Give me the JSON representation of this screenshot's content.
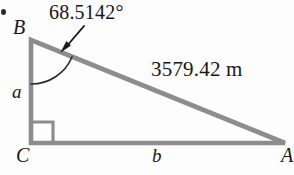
{
  "figure": {
    "type": "right-triangle-diagram",
    "stroke_color": "#8d8d8d",
    "accent_color": "#1a1a1a",
    "background_color": "#fdfdfd",
    "vertices": {
      "B": {
        "label": "B",
        "x": 31,
        "y": 40
      },
      "C": {
        "label": "C",
        "x": 31,
        "y": 143
      },
      "A": {
        "label": "A",
        "x": 285,
        "y": 143
      }
    },
    "sides": {
      "leg_vertical": {
        "label": "a",
        "from": "B",
        "to": "C"
      },
      "leg_horizontal": {
        "label": "b",
        "from": "C",
        "to": "A"
      },
      "hypotenuse": {
        "label": "3579.42 m",
        "value": 3579.42,
        "unit": "m",
        "from": "B",
        "to": "A"
      }
    },
    "angles": {
      "at_B": {
        "label": "68.5142°",
        "value": 68.5142,
        "unit": "degrees",
        "marker": "arc-with-arrow"
      },
      "at_C": {
        "label": "",
        "value": 90,
        "unit": "degrees",
        "marker": "right-angle-square"
      }
    }
  }
}
